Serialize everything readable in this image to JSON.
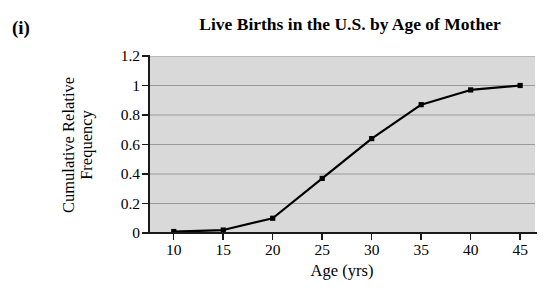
{
  "figure": {
    "enumeration_label": "(i)"
  },
  "chart_data": {
    "type": "line",
    "title": "Live Births in the U.S. by Age of Mother",
    "xlabel": "Age (yrs)",
    "ylabel_lines": [
      "Cumulative Relative",
      "Frequency"
    ],
    "ylabel": "Cumulative Relative Frequency",
    "x": [
      10,
      15,
      20,
      25,
      30,
      35,
      40,
      45
    ],
    "values": [
      0.01,
      0.02,
      0.1,
      0.37,
      0.64,
      0.87,
      0.97,
      1.0
    ],
    "xtick_labels": [
      "10",
      "15",
      "20",
      "25",
      "30",
      "35",
      "40",
      "45"
    ],
    "ytick_labels": [
      "0",
      "0.2",
      "0.4",
      "0.6",
      "0.8",
      "1",
      "1.2"
    ],
    "yticks": [
      0,
      0.2,
      0.4,
      0.6,
      0.8,
      1,
      1.2
    ],
    "xlim": [
      7.5,
      46.5
    ],
    "ylim": [
      0,
      1.2
    ],
    "grid": "horizontal",
    "legend": "none",
    "marker": "square",
    "line_color": "#000000",
    "plot_background": "#d9d9d9",
    "gridline_color": "#9a9a9a"
  }
}
